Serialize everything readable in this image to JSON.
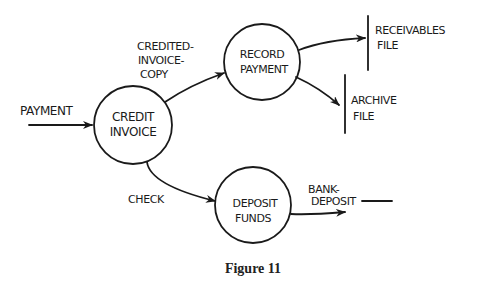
{
  "figure": {
    "caption": "Figure 11",
    "type": "data-flow-diagram"
  },
  "processes": [
    {
      "id": "credit-invoice",
      "line1": "CREDIT",
      "line2": "INVOICE"
    },
    {
      "id": "record-payment",
      "line1": "RECORD",
      "line2": "PAYMENT"
    },
    {
      "id": "deposit-funds",
      "line1": "DEPOSIT",
      "line2": "FUNDS"
    }
  ],
  "data_stores": [
    {
      "id": "receivables-file",
      "line1": "RECEIVABLES",
      "line2": "FILE"
    },
    {
      "id": "archive-file",
      "line1": "ARCHIVE",
      "line2": "FILE"
    }
  ],
  "flows": [
    {
      "id": "payment",
      "label": "PAYMENT",
      "from": "external",
      "to": "credit-invoice"
    },
    {
      "id": "credited-invoice-copy",
      "label_lines": [
        "CREDITED-",
        "INVOICE-",
        "COPY"
      ],
      "from": "credit-invoice",
      "to": "record-payment"
    },
    {
      "id": "check",
      "label": "CHECK",
      "from": "credit-invoice",
      "to": "deposit-funds"
    },
    {
      "id": "to-receivables",
      "label": "",
      "from": "record-payment",
      "to": "receivables-file"
    },
    {
      "id": "to-archive",
      "label": "",
      "from": "record-payment",
      "to": "archive-file"
    },
    {
      "id": "bank-deposit",
      "label_lines": [
        "BANK-",
        "DEPOSIT"
      ],
      "from": "deposit-funds",
      "to": "external"
    }
  ]
}
